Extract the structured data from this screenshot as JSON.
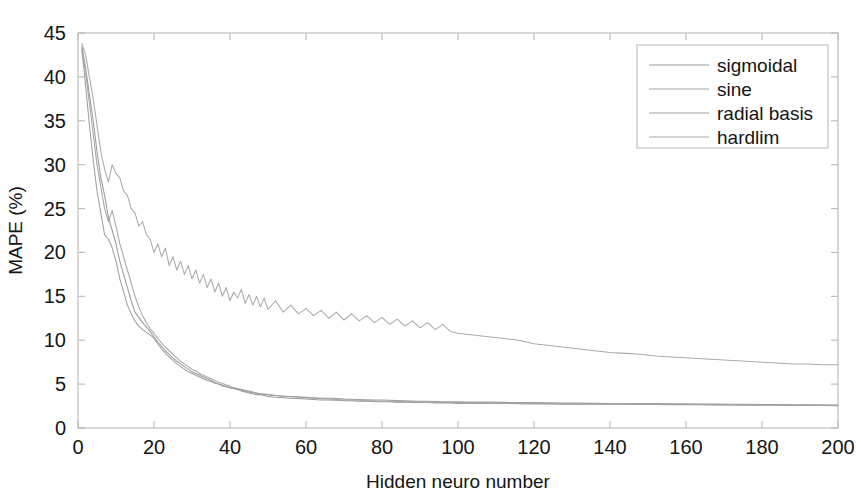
{
  "chart_data": {
    "type": "line",
    "title": "",
    "xlabel": "Hidden neuro number",
    "ylabel": "MAPE (%)",
    "xlim": [
      0,
      200
    ],
    "ylim": [
      0,
      45
    ],
    "xticks": [
      0,
      20,
      40,
      60,
      80,
      100,
      120,
      140,
      160,
      180,
      200
    ],
    "yticks": [
      0,
      5,
      10,
      15,
      20,
      25,
      30,
      35,
      40,
      45
    ],
    "grid": false,
    "legend_position": "top-right",
    "legend_entries": [
      "sigmoidal",
      "sine",
      "radial basis",
      "hardlim"
    ],
    "x": [
      1,
      2,
      3,
      4,
      5,
      6,
      7,
      8,
      9,
      10,
      11,
      12,
      13,
      14,
      15,
      16,
      17,
      18,
      19,
      20,
      21,
      22,
      23,
      24,
      25,
      26,
      27,
      28,
      29,
      30,
      31,
      32,
      33,
      34,
      35,
      36,
      37,
      38,
      39,
      40,
      41,
      42,
      43,
      44,
      45,
      46,
      47,
      48,
      49,
      50,
      52,
      54,
      56,
      58,
      60,
      62,
      64,
      66,
      68,
      70,
      72,
      74,
      76,
      78,
      80,
      82,
      84,
      86,
      88,
      90,
      92,
      94,
      96,
      98,
      100,
      104,
      108,
      112,
      116,
      120,
      124,
      128,
      132,
      136,
      140,
      144,
      148,
      152,
      156,
      160,
      164,
      168,
      172,
      176,
      180,
      184,
      188,
      192,
      196,
      200
    ],
    "series": [
      {
        "name": "sigmoidal",
        "color": "#9a9a9a",
        "values": [
          43.5,
          41.0,
          38.0,
          35.0,
          31.5,
          28.5,
          26.5,
          24.0,
          22.5,
          21.0,
          19.0,
          17.5,
          16.0,
          14.5,
          13.2,
          12.6,
          12.0,
          11.5,
          11.0,
          10.4,
          9.8,
          9.3,
          8.8,
          8.4,
          8.0,
          7.6,
          7.3,
          7.0,
          6.7,
          6.4,
          6.2,
          6.0,
          5.8,
          5.6,
          5.4,
          5.2,
          5.0,
          4.9,
          4.7,
          4.6,
          4.5,
          4.4,
          4.2,
          4.1,
          4.0,
          3.9,
          3.8,
          3.8,
          3.7,
          3.6,
          3.5,
          3.45,
          3.4,
          3.35,
          3.3,
          3.25,
          3.2,
          3.2,
          3.15,
          3.1,
          3.1,
          3.05,
          3.05,
          3.0,
          3.0,
          3.0,
          2.95,
          2.95,
          2.9,
          2.9,
          2.9,
          2.85,
          2.85,
          2.85,
          2.8,
          2.8,
          2.8,
          2.78,
          2.78,
          2.75,
          2.75,
          2.72,
          2.72,
          2.7,
          2.7,
          2.7,
          2.68,
          2.68,
          2.65,
          2.65,
          2.65,
          2.62,
          2.62,
          2.6,
          2.6,
          2.6,
          2.58,
          2.58,
          2.58,
          2.55
        ]
      },
      {
        "name": "sine",
        "color": "#a5a5a5",
        "values": [
          43.0,
          40.5,
          37.0,
          33.5,
          30.0,
          27.5,
          25.0,
          23.5,
          24.8,
          23.0,
          21.0,
          19.5,
          18.0,
          16.5,
          15.0,
          13.8,
          12.8,
          12.0,
          11.3,
          10.8,
          10.2,
          9.7,
          9.2,
          8.8,
          8.4,
          8.0,
          7.6,
          7.3,
          7.0,
          6.7,
          6.5,
          6.2,
          6.0,
          5.8,
          5.6,
          5.4,
          5.2,
          5.1,
          4.9,
          4.8,
          4.6,
          4.5,
          4.4,
          4.3,
          4.2,
          4.1,
          4.0,
          3.9,
          3.85,
          3.8,
          3.7,
          3.6,
          3.55,
          3.5,
          3.45,
          3.4,
          3.35,
          3.3,
          3.25,
          3.2,
          3.2,
          3.15,
          3.1,
          3.1,
          3.05,
          3.05,
          3.0,
          3.0,
          3.0,
          2.95,
          2.95,
          2.9,
          2.9,
          2.9,
          2.9,
          2.85,
          2.85,
          2.82,
          2.8,
          2.8,
          2.78,
          2.78,
          2.75,
          2.75,
          2.72,
          2.72,
          2.7,
          2.7,
          2.7,
          2.68,
          2.68,
          2.65,
          2.65,
          2.65,
          2.62,
          2.62,
          2.6,
          2.6,
          2.6,
          2.58
        ]
      },
      {
        "name": "radial basis",
        "color": "#9f9f9f",
        "values": [
          43.2,
          39.0,
          34.5,
          30.5,
          27.0,
          24.5,
          22.0,
          21.5,
          20.5,
          19.0,
          17.0,
          15.5,
          14.0,
          13.0,
          12.2,
          11.6,
          11.2,
          10.9,
          10.6,
          10.2,
          9.6,
          9.0,
          8.5,
          8.1,
          7.7,
          7.3,
          7.0,
          6.7,
          6.4,
          6.2,
          6.0,
          5.8,
          5.6,
          5.4,
          5.3,
          5.1,
          5.0,
          4.8,
          4.7,
          4.6,
          4.5,
          4.4,
          4.3,
          4.2,
          4.1,
          4.0,
          3.95,
          3.9,
          3.85,
          3.8,
          3.7,
          3.65,
          3.6,
          3.55,
          3.5,
          3.45,
          3.4,
          3.38,
          3.35,
          3.3,
          3.28,
          3.25,
          3.22,
          3.2,
          3.18,
          3.15,
          3.12,
          3.1,
          3.08,
          3.05,
          3.05,
          3.02,
          3.0,
          3.0,
          2.98,
          2.95,
          2.95,
          2.92,
          2.9,
          2.9,
          2.88,
          2.85,
          2.85,
          2.82,
          2.8,
          2.8,
          2.78,
          2.78,
          2.75,
          2.75,
          2.72,
          2.72,
          2.7,
          2.7,
          2.68,
          2.68,
          2.65,
          2.65,
          2.62,
          2.6
        ]
      },
      {
        "name": "hardlim",
        "color": "#aaaaaa",
        "values": [
          43.8,
          42.5,
          40.0,
          37.5,
          34.5,
          31.5,
          29.5,
          28.0,
          30.0,
          29.0,
          28.5,
          27.0,
          26.5,
          25.0,
          24.5,
          23.0,
          23.5,
          22.0,
          21.5,
          20.0,
          21.0,
          19.5,
          20.5,
          18.5,
          19.5,
          18.0,
          19.0,
          17.5,
          18.5,
          17.0,
          18.0,
          16.5,
          17.5,
          16.0,
          17.0,
          15.5,
          16.5,
          15.0,
          16.0,
          14.5,
          15.5,
          14.8,
          15.8,
          14.2,
          15.2,
          14.0,
          15.0,
          13.8,
          14.8,
          13.5,
          14.5,
          13.2,
          14.0,
          13.0,
          13.6,
          12.8,
          13.4,
          12.5,
          13.2,
          12.3,
          13.0,
          12.2,
          12.8,
          12.0,
          12.6,
          11.8,
          12.4,
          11.6,
          12.2,
          11.4,
          12.0,
          11.2,
          11.8,
          11.0,
          10.8,
          10.6,
          10.4,
          10.2,
          10.0,
          9.6,
          9.4,
          9.2,
          9.0,
          8.8,
          8.6,
          8.5,
          8.4,
          8.2,
          8.1,
          8.0,
          7.9,
          7.8,
          7.7,
          7.6,
          7.5,
          7.4,
          7.3,
          7.3,
          7.2,
          7.2
        ]
      }
    ]
  }
}
